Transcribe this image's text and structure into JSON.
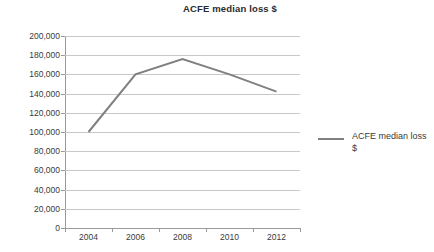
{
  "chart_data": {
    "type": "line",
    "title": "ACFE median loss $",
    "xlabel": "",
    "ylabel": "",
    "x": [
      2004,
      2006,
      2008,
      2010,
      2012
    ],
    "x_tick_labels": [
      "2004",
      "2006",
      "2008",
      "2010",
      "2012"
    ],
    "series": [
      {
        "name": "ACFE median loss $",
        "color": "#808080",
        "values": [
          100000,
          160000,
          176000,
          160000,
          142000
        ]
      }
    ],
    "ylim": [
      0,
      200000
    ],
    "y_ticks": [
      0,
      20000,
      40000,
      60000,
      80000,
      100000,
      120000,
      140000,
      160000,
      180000,
      200000
    ],
    "y_tick_labels": [
      "200,000",
      "180,000",
      "160,000",
      "140,000",
      "120,000",
      "100,000",
      "80,000",
      "60,000",
      "40,000",
      "20,000",
      "0"
    ],
    "grid": "horizontal",
    "legend_position": "right",
    "legend_entries": [
      "ACFE median loss $"
    ]
  },
  "legend": {
    "entry_label": "ACFE median loss $"
  },
  "colors": {
    "series": "#808080",
    "gridline": "#c8c8c8",
    "axis": "#9a9a9a",
    "text": "#3a3a3a",
    "background": "#ffffff"
  }
}
